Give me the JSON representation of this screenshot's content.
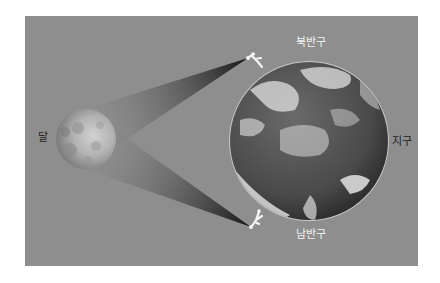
{
  "diagram": {
    "labels": {
      "moon": "달",
      "earth": "지구",
      "north_hemisphere": "북반구",
      "south_hemisphere": "남반구"
    },
    "colors": {
      "background": "#8e8e8e",
      "sight_cone_dark": "#151515",
      "observer": "#f4f4f4"
    }
  }
}
